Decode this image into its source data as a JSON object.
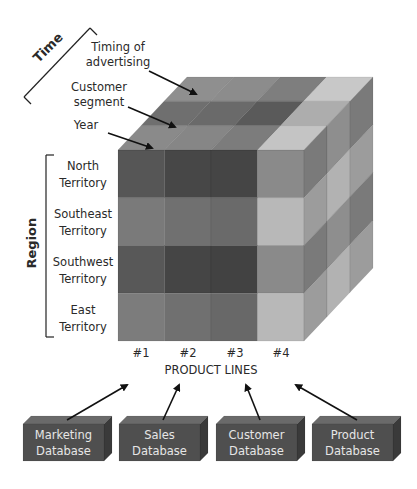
{
  "time_axis": {
    "label": "Time",
    "items": [
      {
        "line1": "Timing of",
        "line2": "advertising"
      },
      {
        "line1": "Customer",
        "line2": "segment"
      },
      {
        "line1": "Year",
        "line2": ""
      }
    ]
  },
  "region_axis": {
    "label": "Region",
    "items": [
      {
        "line1": "North",
        "line2": "Territory"
      },
      {
        "line1": "Southeast",
        "line2": "Territory"
      },
      {
        "line1": "Southwest",
        "line2": "Territory"
      },
      {
        "line1": "East",
        "line2": "Territory"
      }
    ]
  },
  "product_axis": {
    "label": "PRODUCT LINES",
    "columns": [
      "#1",
      "#2",
      "#3",
      "#4"
    ]
  },
  "databases": [
    {
      "line1": "Marketing",
      "line2": "Database"
    },
    {
      "line1": "Sales",
      "line2": "Database"
    },
    {
      "line1": "Customer",
      "line2": "Database"
    },
    {
      "line1": "Product",
      "line2": "Database"
    }
  ],
  "colors": {
    "front": [
      [
        "#565656",
        "#474747",
        "#454545",
        "#8a8a8a"
      ],
      [
        "#7a7a7a",
        "#707070",
        "#6a6a6a",
        "#b8b8b8"
      ],
      [
        "#585858",
        "#454545",
        "#424242",
        "#8a8a8a"
      ],
      [
        "#7c7c7c",
        "#707070",
        "#686868",
        "#b8b8b8"
      ]
    ],
    "top": [
      [
        "#8f8f8f",
        "#8c8c8c",
        "#7e7e7e",
        "#c8c8c8"
      ],
      [
        "#6f6f6f",
        "#6a6a6a",
        "#5a5a5a",
        "#adadad"
      ],
      [
        "#8a8a8a",
        "#868686",
        "#7c7c7c",
        "#c4c4c4"
      ]
    ],
    "side": [
      [
        "#7a7a7a",
        "#8e8e8e",
        "#7a7a7a"
      ],
      [
        "#9c9c9c",
        "#b2b2b2",
        "#9c9c9c"
      ],
      [
        "#7a7a7a",
        "#8e8e8e",
        "#7a7a7a"
      ],
      [
        "#9c9c9c",
        "#b2b2b2",
        "#9c9c9c"
      ]
    ],
    "db_front": "#4f4f4f",
    "db_top": "#6a6a6a",
    "db_side": "#3a3a3a",
    "db_text": "#e6e6e6"
  }
}
